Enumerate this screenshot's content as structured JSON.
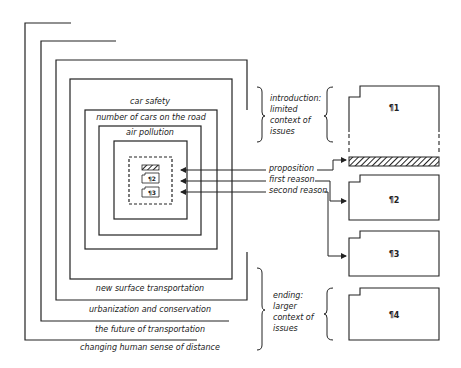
{
  "diagram": {
    "nested_contexts": {
      "inner_labels": [
        "car safety",
        "number of cars on the road",
        "air pollution"
      ],
      "outer_labels": [
        "new surface transportation",
        "urbanization and conservation",
        "the future of transportation",
        "changing human sense of distance"
      ]
    },
    "core_elements": {
      "mini_paragraphs": [
        "¶2",
        "¶3"
      ]
    },
    "arrows": {
      "proposition": "proposition",
      "first_reason": "first reason",
      "second_reason": "second reason"
    },
    "notes": {
      "introduction": [
        "introduction:",
        "limited",
        "context of",
        "issues"
      ],
      "ending": [
        "ending:",
        "larger",
        "context of",
        "issues"
      ]
    },
    "paragraphs": [
      "¶1",
      "¶2",
      "¶3",
      "¶4"
    ],
    "colors": {
      "ink": "#222222",
      "background": "#ffffff"
    }
  }
}
